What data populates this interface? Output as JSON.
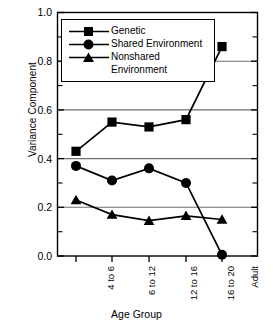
{
  "chart_data": {
    "type": "line",
    "title": "",
    "xlabel": "Age Group",
    "ylabel": "Variance Component",
    "categories": [
      "4 to 6",
      "6 to 12",
      "12 to 16",
      "16 to 20",
      "Adult"
    ],
    "ylim": [
      0.0,
      1.0
    ],
    "ytick_labels": [
      "0.0",
      "0.2",
      "0.4",
      "0.6",
      "0.8",
      "1.0"
    ],
    "ytick_values": [
      0.0,
      0.2,
      0.4,
      0.6,
      0.8,
      1.0
    ],
    "yminor_values": [
      0.1,
      0.3,
      0.5,
      0.7,
      0.9
    ],
    "grid": "horizontal",
    "legend_position": "top-left-inside",
    "series": [
      {
        "name": "Genetic",
        "marker": "square",
        "color": "#000000",
        "values": [
          0.43,
          0.55,
          0.53,
          0.56,
          0.86
        ]
      },
      {
        "name": "Shared Environment",
        "marker": "circle",
        "color": "#000000",
        "values": [
          0.37,
          0.31,
          0.36,
          0.3,
          0.005
        ]
      },
      {
        "name": "Nonshared Environment",
        "marker": "triangle",
        "color": "#000000",
        "values": [
          0.23,
          0.17,
          0.145,
          0.165,
          0.15
        ]
      }
    ]
  },
  "legend": {
    "entries": [
      {
        "label": "Genetic",
        "marker": "square"
      },
      {
        "label": "Shared Environment",
        "marker": "circle"
      },
      {
        "label": "Nonshared",
        "label_cont": "Environment",
        "marker": "triangle"
      }
    ]
  },
  "axes": {
    "y_title": "Variance Component",
    "x_title": "Age Group",
    "y_labels": [
      "1.0",
      "0.8",
      "0.6",
      "0.4",
      "0.2",
      "0.0"
    ],
    "x_labels": [
      "4 to 6",
      "6 to 12",
      "12 to 16",
      "16 to 20",
      "Adult"
    ]
  },
  "colors": {
    "frame": "#000000",
    "grid": "#6f6f6f",
    "series": "#000000",
    "background": "#ffffff"
  }
}
